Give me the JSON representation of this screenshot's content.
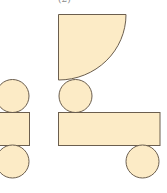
{
  "figure": {
    "label": "(2)",
    "fill_color": "#FCEBC6",
    "stroke_color": "#6B5E4E"
  },
  "left_net": {
    "shapes": [
      "circle-top",
      "rectangle",
      "circle-bottom"
    ]
  },
  "right_net": {
    "shapes": [
      "quarter-circle",
      "circle-top",
      "rectangle",
      "circle-bottom-right"
    ]
  }
}
